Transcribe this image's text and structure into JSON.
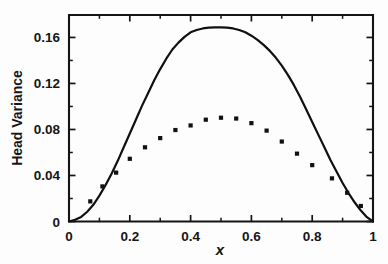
{
  "chart_data": {
    "type": "line",
    "title": "",
    "subtitle": "",
    "xlabel": "x",
    "ylabel": "Head Variance",
    "xlim": [
      0,
      1
    ],
    "ylim": [
      0,
      0.1795
    ],
    "grid": false,
    "legend": null,
    "x_ticks": [
      0,
      0.2,
      0.4,
      0.6,
      0.8,
      1
    ],
    "x_tick_labels": [
      "0",
      "0.2",
      "0.4",
      "0.6",
      "0.8",
      "1"
    ],
    "x_minor_ticks": [
      0.1,
      0.3,
      0.5,
      0.7,
      0.9
    ],
    "y_ticks": [
      0,
      0.04,
      0.08,
      0.12,
      0.16
    ],
    "y_tick_labels": [
      "0",
      "0.04",
      "0.08",
      "0.12",
      "0.16"
    ],
    "y_minor_ticks": [
      0.02,
      0.06,
      0.1,
      0.14
    ],
    "series": [
      {
        "name": "analytical-curve",
        "type": "line",
        "style": "solid",
        "color": "#101010",
        "x": [
          0.0,
          0.02,
          0.04,
          0.06,
          0.08,
          0.1,
          0.12,
          0.14,
          0.16,
          0.18,
          0.2,
          0.22,
          0.24,
          0.26,
          0.28,
          0.3,
          0.32,
          0.34,
          0.36,
          0.38,
          0.4,
          0.42,
          0.44,
          0.46,
          0.48,
          0.5,
          0.52,
          0.54,
          0.56,
          0.58,
          0.6,
          0.62,
          0.64,
          0.66,
          0.68,
          0.7,
          0.72,
          0.74,
          0.76,
          0.78,
          0.8,
          0.82,
          0.84,
          0.86,
          0.88,
          0.9,
          0.92,
          0.94,
          0.96,
          0.98,
          1.0
        ],
        "y": [
          0.0,
          0.0015,
          0.004,
          0.0085,
          0.0145,
          0.0225,
          0.0315,
          0.0415,
          0.0525,
          0.0645,
          0.0765,
          0.0885,
          0.1005,
          0.1115,
          0.1225,
          0.1325,
          0.1415,
          0.1495,
          0.1555,
          0.1605,
          0.1645,
          0.1665,
          0.1678,
          0.1685,
          0.1688,
          0.1688,
          0.1685,
          0.1678,
          0.1665,
          0.1645,
          0.1615,
          0.1578,
          0.1535,
          0.1485,
          0.1425,
          0.1355,
          0.1275,
          0.1185,
          0.1085,
          0.0975,
          0.0865,
          0.0755,
          0.0645,
          0.0535,
          0.0435,
          0.0335,
          0.0245,
          0.0165,
          0.0095,
          0.0038,
          0.0
        ]
      },
      {
        "name": "numerical-points",
        "type": "scatter",
        "marker": "square",
        "color": "#111111",
        "x": [
          0.07,
          0.11,
          0.155,
          0.2,
          0.25,
          0.3,
          0.35,
          0.4,
          0.45,
          0.5,
          0.55,
          0.6,
          0.65,
          0.7,
          0.75,
          0.8,
          0.865,
          0.915,
          0.96
        ],
        "y": [
          0.0175,
          0.0305,
          0.0425,
          0.0545,
          0.0645,
          0.0725,
          0.0795,
          0.0835,
          0.0885,
          0.0902,
          0.0895,
          0.0855,
          0.079,
          0.0695,
          0.059,
          0.049,
          0.0375,
          0.025,
          0.0135
        ]
      }
    ]
  }
}
